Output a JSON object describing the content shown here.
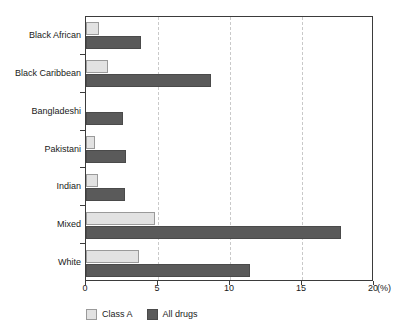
{
  "chart_data": {
    "type": "bar",
    "orientation": "horizontal",
    "title": "",
    "xlabel": "(%)",
    "ylabel": "",
    "xlim": [
      0,
      20
    ],
    "xticks": [
      0,
      5,
      10,
      15,
      20
    ],
    "xtick_labels": [
      "0",
      "5",
      "10",
      "15",
      "20"
    ],
    "unit": "(%)",
    "grid": true,
    "grid_axis": "x",
    "legend_position": "bottom-left",
    "categories": [
      "Black African",
      "Black Caribbean",
      "Bangladeshi",
      "Pakistani",
      "Indian",
      "Mixed",
      "White"
    ],
    "series": [
      {
        "name": "Class A",
        "color": "#e2e2e2",
        "values": [
          0.9,
          1.5,
          0.0,
          0.6,
          0.8,
          4.8,
          3.7
        ]
      },
      {
        "name": "All drugs",
        "color": "#5a5a5a",
        "values": [
          3.8,
          8.7,
          2.6,
          2.8,
          2.7,
          17.7,
          11.4
        ]
      }
    ]
  },
  "legend": {
    "items": [
      {
        "label": "Class A",
        "color": "#e2e2e2"
      },
      {
        "label": "All drugs",
        "color": "#5a5a5a"
      }
    ]
  },
  "colors": {
    "class_a": "#e2e2e2",
    "all_drugs": "#5a5a5a",
    "axis": "#3b3b3b",
    "gridline": "#c9c9c9",
    "background": "#ffffff",
    "text": "#1a1a1a"
  }
}
